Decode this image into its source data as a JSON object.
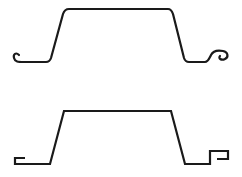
{
  "diagram": {
    "type": "sheet-pile-profiles",
    "stroke_color": "#1a1a1a",
    "background": "#ffffff",
    "profiles": [
      {
        "name": "curved-hook-interlock-profile",
        "interlock_style": "rounded hook",
        "path": "M 19 55 C 16 52, 13 54, 14 58 C 15 62, 18 62, 24 62 L 46 62 C 49 62, 50 61, 51 58 L 63 14 C 64 11, 66 9, 69 9 L 168 9 C 171 9, 172 11, 173 14 L 184 58 C 185 61, 186 62, 189 62 L 205 62 C 208 62, 209 59, 211 55 C 213 51, 218 50, 223 51 C 228 52, 229 57, 225 59 C 221 61, 218 58, 220 56"
      },
      {
        "name": "box-hook-interlock-profile",
        "interlock_style": "rectangular hook",
        "path": "M 25 158 L 15 158 L 15 164 L 50 164 L 64 111 L 171 111 L 185 164 L 210 164 L 210 151 L 228 151 L 228 159 L 217 159"
      }
    ]
  }
}
